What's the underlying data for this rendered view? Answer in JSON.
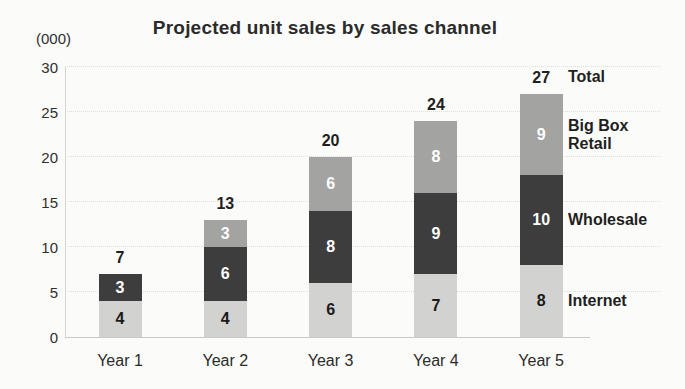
{
  "chart_data": {
    "type": "bar",
    "variant": "stacked",
    "title": "Projected unit sales by sales channel",
    "y_unit_label": "(000)",
    "categories": [
      "Year 1",
      "Year 2",
      "Year 3",
      "Year 4",
      "Year 5"
    ],
    "series": [
      {
        "name": "Internet",
        "color": "#d2d2d0",
        "label_color": "#1a1a1a",
        "values": [
          4,
          4,
          6,
          7,
          8
        ]
      },
      {
        "name": "Wholesale",
        "color": "#3d3d3d",
        "label_color": "#ffffff",
        "values": [
          3,
          6,
          8,
          9,
          10
        ]
      },
      {
        "name": "Big Box Retail",
        "color": "#a3a3a1",
        "label_color": "#ffffff",
        "values": [
          0,
          3,
          6,
          8,
          9
        ]
      }
    ],
    "totals": [
      7,
      13,
      20,
      24,
      27
    ],
    "total_label": "Total",
    "ylim": [
      0,
      30
    ],
    "yticks": [
      0,
      5,
      10,
      15,
      20,
      25,
      30
    ],
    "grid": "horizontal-dotted",
    "legend_position": "right",
    "axis_color": "#d4d4d0"
  }
}
